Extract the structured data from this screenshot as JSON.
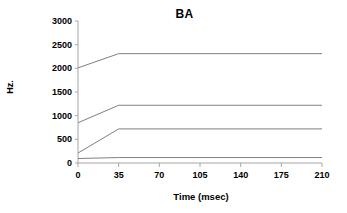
{
  "chart_data": {
    "type": "line",
    "title": "BA",
    "xlabel": "Time (msec)",
    "ylabel": "Hz.",
    "xlim": [
      0,
      210
    ],
    "ylim": [
      0,
      3000
    ],
    "grid": false,
    "legend": "none",
    "x": [
      0,
      35,
      210
    ],
    "xticks": [
      "0",
      "35",
      "70",
      "105",
      "140",
      "175",
      "210"
    ],
    "xtick_values": [
      0,
      35,
      70,
      105,
      140,
      175,
      210
    ],
    "yticks": [
      "0",
      "500",
      "1000",
      "1500",
      "2000",
      "2500",
      "3000"
    ],
    "ytick_values": [
      0,
      500,
      1000,
      1500,
      2000,
      2500,
      3000
    ],
    "series": [
      {
        "name": "F4",
        "values": [
          2010,
          2310,
          2310
        ]
      },
      {
        "name": "F3",
        "values": [
          850,
          1220,
          1220
        ]
      },
      {
        "name": "F2",
        "values": [
          210,
          720,
          720
        ]
      },
      {
        "name": "F1",
        "values": [
          95,
          115,
          115
        ]
      }
    ],
    "line_color": "#808080",
    "axis_color": "#a6a6a6",
    "text_color": "#000000"
  }
}
